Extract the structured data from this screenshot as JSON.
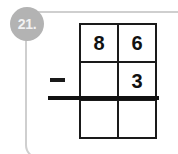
{
  "worksheet": {
    "question_number": "21.",
    "problem_type": "vertical-subtraction",
    "operator_symbol": "−",
    "operator_name": "minus-sign",
    "frame_color": "#cfcfcf",
    "badge_color": "#b3b3b3",
    "badge_text_color": "#f2f2f2",
    "ink_color": "#111111",
    "grid": {
      "columns": 2,
      "rows": 3,
      "cells": [
        {
          "name": "minuend-tens",
          "value": "8"
        },
        {
          "name": "minuend-ones",
          "value": "6"
        },
        {
          "name": "subtrahend-tens",
          "value": ""
        },
        {
          "name": "subtrahend-ones",
          "value": "3"
        },
        {
          "name": "difference-tens",
          "value": ""
        },
        {
          "name": "difference-ones",
          "value": ""
        }
      ]
    }
  }
}
